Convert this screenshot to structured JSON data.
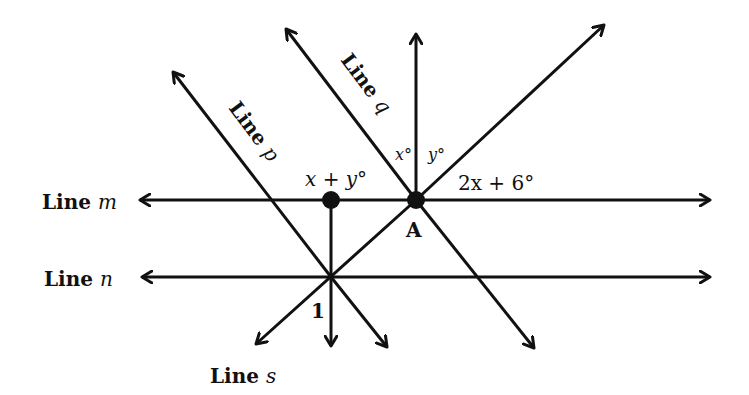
{
  "diagram": {
    "type": "geometry-parallel-lines-transversals",
    "lines": {
      "m": {
        "label": "Line",
        "var": "m"
      },
      "n": {
        "label": "Line",
        "var": "n"
      },
      "p": {
        "label": "Line",
        "var": "p"
      },
      "q": {
        "label": "Line",
        "var": "q"
      },
      "s": {
        "label": "Line",
        "var": "s"
      }
    },
    "points": {
      "A": "A"
    },
    "angles": {
      "x": "x°",
      "y": "y°",
      "two_x_plus_6": "2x + 6°",
      "x_plus_y": "x + y°",
      "one": "1"
    },
    "colors": {
      "stroke": "#111111",
      "background": "#ffffff"
    }
  }
}
